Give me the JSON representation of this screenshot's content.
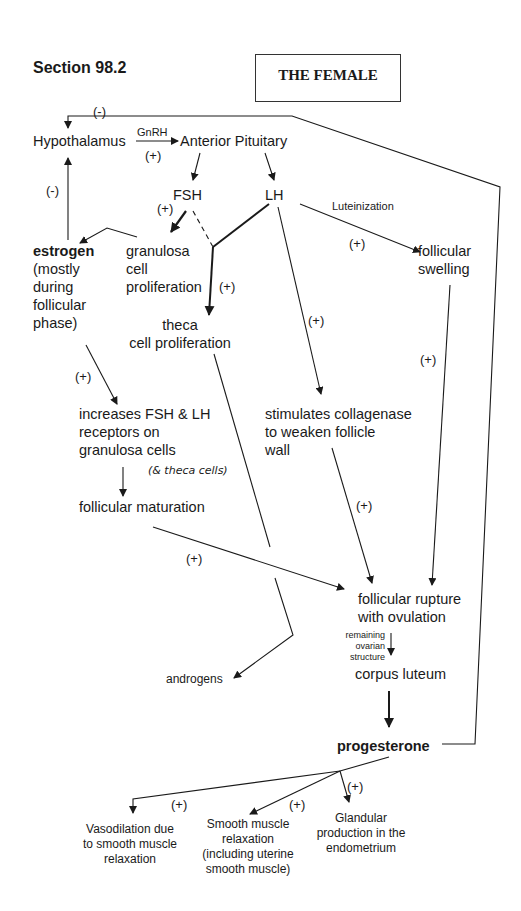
{
  "header": {
    "section": "Section 98.2",
    "title": "THE FEMALE"
  },
  "nodes": {
    "hypothalamus": "Hypothalamus",
    "anterior_pituitary": "Anterior Pituitary",
    "fsh": "FSH",
    "lh": "LH",
    "estrogen": "estrogen",
    "estrogen_note": "(mostly\nduring\nfollicular\nphase)",
    "granulosa": "granulosa\ncell\nproliferation",
    "theca": "theca\ncell proliferation",
    "follicular_swelling": "follicular\nswelling",
    "increases_receptors": "increases FSH & LH\nreceptors on\ngranulosa cells",
    "theca_cells_note": "(& theca cells)",
    "collagenase": "stimulates collagenase\nto weaken follicle\nwall",
    "follicular_maturation": "follicular maturation",
    "follicular_rupture": "follicular rupture\nwith ovulation",
    "remaining_structure": "remaining\novarian\nstructure",
    "corpus_luteum": "corpus luteum",
    "androgens": "androgens",
    "progesterone": "progesterone",
    "vasodilation": "Vasodilation due\nto smooth muscle\nrelaxation",
    "smooth_muscle": "Smooth muscle\nrelaxation\n(including uterine\nsmooth muscle)",
    "glandular": "Glandular\nproduction in the\nendometrium"
  },
  "edge_labels": {
    "gnrh": "GnRH",
    "luteinization": "Luteinization",
    "neg_top": "(-)",
    "neg_left": "(-)",
    "pos_gnrh": "(+)",
    "pos_fsh": "(+)",
    "pos_lh_theca": "(+)",
    "pos_luteinization": "(+)",
    "pos_lh_collagenase": "(+)",
    "pos_swelling": "(+)",
    "pos_estrogen": "(+)",
    "pos_collagenase": "(+)",
    "pos_maturation": "(+)",
    "pos_vaso": "(+)",
    "pos_smooth": "(+)",
    "pos_glandular": "(+)"
  }
}
